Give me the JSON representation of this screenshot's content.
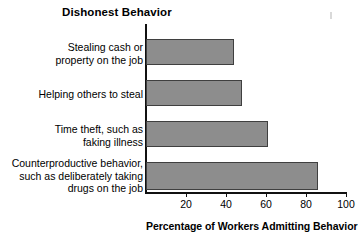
{
  "chart_data": {
    "type": "bar",
    "orientation": "horizontal",
    "title": "Dishonest Behavior",
    "xlabel": "Percentage of Workers Admitting Behavior",
    "ylabel": "Dishonest Behavior",
    "categories": [
      "Stealing cash or\nproperty on the job",
      "Helping others to steal",
      "Time theft, such as\nfaking illness",
      "Counterproductive behavior,\nsuch as deliberately taking\ndrugs on the job"
    ],
    "values": [
      44,
      48,
      61,
      86
    ],
    "xlim": [
      0,
      105
    ],
    "xticks": [
      20,
      40,
      60,
      80,
      100
    ],
    "xticklabels": [
      "20",
      "40",
      "60",
      "80",
      "100"
    ],
    "grid": false,
    "legend": null,
    "bar_fill_color": "#8d8d8d",
    "bar_edge_color": "#3f3f3f",
    "axis_color": "#111111",
    "background_color": "#ffffff"
  },
  "layout": {
    "axis_origin_px": 146,
    "px_per_unit": 2.0,
    "bars": [
      {
        "top": 39,
        "height": 26
      },
      {
        "top": 80,
        "height": 26
      },
      {
        "top": 121,
        "height": 26
      },
      {
        "top": 162,
        "height": 28
      }
    ],
    "label_tops": [
      41,
      88,
      123,
      157
    ]
  }
}
